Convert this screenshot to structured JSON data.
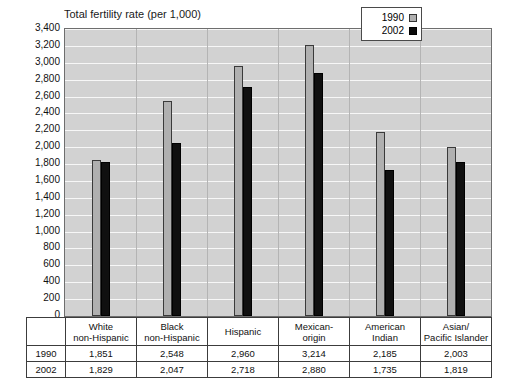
{
  "chart_data": {
    "type": "bar",
    "title": "Total fertility rate (per 1,000)",
    "xlabel": "",
    "ylabel": "",
    "ylim": [
      0,
      3400
    ],
    "ytick_step": 200,
    "grid": true,
    "legend_position": "top-right",
    "categories": [
      "White non-Hispanic",
      "Black non-Hispanic",
      "Hispanic",
      "Mexican-origin",
      "American Indian",
      "Asian/ Pacific Islander"
    ],
    "category_lines": [
      [
        "White",
        "non-Hispanic"
      ],
      [
        "Black",
        "non-Hispanic"
      ],
      [
        "Hispanic",
        ""
      ],
      [
        "Mexican-",
        "origin"
      ],
      [
        "American",
        "Indian"
      ],
      [
        "Asian/",
        "Pacific Islander"
      ]
    ],
    "series": [
      {
        "name": "1990",
        "color": "#b0b0b0",
        "values": [
          1851,
          2548,
          2960,
          3214,
          2185,
          2003
        ],
        "labels": [
          "1,851",
          "2,548",
          "2,960",
          "3,214",
          "2,185",
          "2,003"
        ]
      },
      {
        "name": "2002",
        "color": "#101010",
        "values": [
          1829,
          2047,
          2718,
          2880,
          1735,
          1819
        ],
        "labels": [
          "1,829",
          "2,047",
          "2,718",
          "2,880",
          "1,735",
          "1,819"
        ]
      }
    ],
    "ytick_labels": [
      "0",
      "200",
      "400",
      "600",
      "800",
      "1,000",
      "1,200",
      "1,400",
      "1,600",
      "1,800",
      "2,000",
      "2,200",
      "2,400",
      "2,600",
      "2,800",
      "3,000",
      "3,200",
      "3,400"
    ],
    "ytick_values": [
      0,
      200,
      400,
      600,
      800,
      1000,
      1200,
      1400,
      1600,
      1800,
      2000,
      2200,
      2400,
      2600,
      2800,
      3000,
      3200,
      3400
    ]
  },
  "legend": {
    "items": [
      {
        "label": "1990",
        "swatch": "light-gray-square"
      },
      {
        "label": "2002",
        "swatch": "black-square"
      }
    ]
  },
  "table": {
    "row_labels": [
      "1990",
      "2002"
    ],
    "columns": [
      [
        "White",
        "non-Hispanic"
      ],
      [
        "Black",
        "non-Hispanic"
      ],
      [
        "Hispanic",
        ""
      ],
      [
        "Mexican-",
        "origin"
      ],
      [
        "American",
        "Indian"
      ],
      [
        "Asian/",
        "Pacific Islander"
      ]
    ],
    "rows": [
      [
        "1,851",
        "2,548",
        "2,960",
        "3,214",
        "2,185",
        "2,003"
      ],
      [
        "1,829",
        "2,047",
        "2,718",
        "2,880",
        "1,735",
        "1,819"
      ]
    ]
  },
  "colors": {
    "plot_background": "#d2d2d2",
    "gridline": "#f7f7f7",
    "series_1990": "#b0b0b0",
    "series_2002": "#101010",
    "border": "#3c3c3c"
  }
}
